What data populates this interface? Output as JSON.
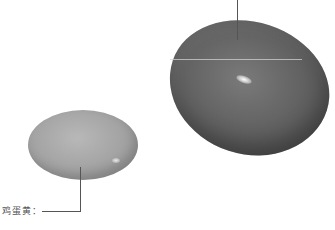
{
  "figure": {
    "type": "anatomy-callout-illustration",
    "objects": [
      {
        "id": "large-egg",
        "description": "dark gray egg-shaped object",
        "color": "#5e5e5e"
      },
      {
        "id": "small-egg",
        "description": "light gray flat round yolk-shaped object",
        "color": "#a2a2a2"
      }
    ],
    "callouts": [
      {
        "target": "small-egg",
        "label": "鸡蛋黄："
      },
      {
        "target": "large-egg",
        "label": ""
      }
    ],
    "colors": {
      "background": "#ffffff",
      "leader_line": "#555555",
      "label_text": "#555555"
    }
  }
}
